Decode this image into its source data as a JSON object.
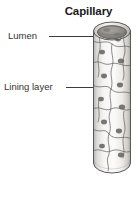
{
  "figure": {
    "title": "Capillary",
    "type": "anatomical-illustration",
    "background_color": "#ffffff",
    "title_color": "#1a1a1a"
  },
  "labels": [
    {
      "id": "lumen",
      "text": "Lumen",
      "points_to": "vessel-opening",
      "leader_color": "#3b3b3b"
    },
    {
      "id": "lining-layer",
      "text": "Lining layer",
      "points_to": "endothelial-cell-wall",
      "leader_color": "#3b3b3b"
    }
  ],
  "illustration": {
    "name": "capillary-tube",
    "outline_color": "#4a4a4a",
    "wall_fill": "#f2f1ef",
    "lumen_fill": "#8d8a86",
    "nucleus_fill": "#6e6b68",
    "cell_border_color": "#5a5754",
    "nuclei_count": 11
  }
}
